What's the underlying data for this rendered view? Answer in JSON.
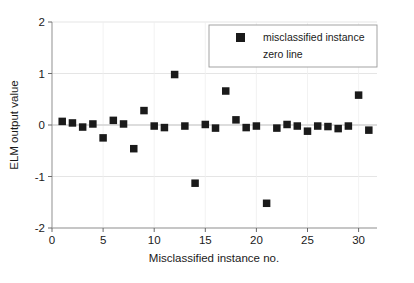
{
  "chart_data": {
    "type": "scatter",
    "title": "",
    "xlabel": "Misclassified instance no.",
    "ylabel": "ELM output value",
    "xlim": [
      0,
      31.8
    ],
    "ylim": [
      -2,
      2
    ],
    "xticks": [
      0,
      5,
      10,
      15,
      20,
      25,
      30
    ],
    "xtick_labels": [
      "0",
      "5",
      "10",
      "15",
      "20",
      "25",
      "30"
    ],
    "yticks": [
      -2,
      -1,
      0,
      1,
      2
    ],
    "ytick_labels": [
      "-2",
      "-1",
      "0",
      "1",
      "2"
    ],
    "grid": true,
    "legend_position": "top-right",
    "marker": "square",
    "marker_color": "#1a1a1a",
    "zero_line_color": "#c8c8c8",
    "series": [
      {
        "name": "misclassified instance",
        "x": [
          1,
          2,
          3,
          4,
          5,
          6,
          7,
          8,
          9,
          10,
          11,
          12,
          13,
          14,
          15,
          16,
          17,
          18,
          19,
          20,
          21,
          22,
          23,
          24,
          25,
          26,
          27,
          28,
          29,
          30,
          31
        ],
        "values": [
          0.07,
          0.04,
          -0.04,
          0.02,
          -0.25,
          0.09,
          0.02,
          -0.46,
          0.28,
          -0.02,
          -0.05,
          0.98,
          -0.02,
          -1.13,
          0.01,
          -0.06,
          0.66,
          0.1,
          -0.05,
          -0.02,
          -1.52,
          -0.06,
          0.01,
          -0.02,
          -0.12,
          -0.02,
          -0.03,
          -0.07,
          -0.02,
          0.58,
          -0.1
        ]
      },
      {
        "name": "zero line",
        "x": [
          0,
          31.8
        ],
        "values": [
          0,
          0
        ]
      }
    ]
  },
  "legend": {
    "entries": [
      {
        "label": "misclassified instance",
        "marker": "square",
        "color": "#1a1a1a"
      },
      {
        "label": "zero line",
        "marker": "none",
        "color": "#c8c8c8"
      }
    ]
  }
}
